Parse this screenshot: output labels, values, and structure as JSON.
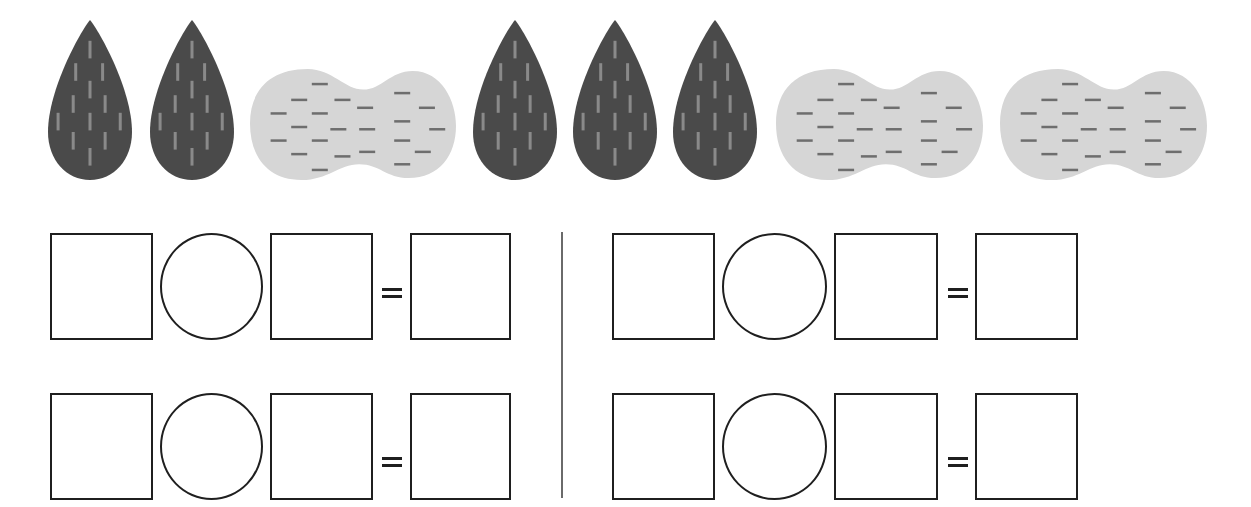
{
  "worksheet": {
    "title": "Count and write number sentences",
    "colors": {
      "almond_fill": "#4a4a4a",
      "almond_stripe": "#8a8a8a",
      "peanut_fill": "#d6d6d6",
      "peanut_dash": "#6e6e6e",
      "outline": "#1f1f1f",
      "divider": "#6a6a6a"
    },
    "picture_row": {
      "items": [
        {
          "icon": "almond-icon",
          "x": 48,
          "y": 20,
          "w": 84,
          "h": 160
        },
        {
          "icon": "almond-icon",
          "x": 150,
          "y": 20,
          "w": 84,
          "h": 160
        },
        {
          "icon": "peanut-icon",
          "x": 250,
          "y": 67,
          "w": 206,
          "h": 113
        },
        {
          "icon": "almond-icon",
          "x": 473,
          "y": 20,
          "w": 84,
          "h": 160
        },
        {
          "icon": "almond-icon",
          "x": 573,
          "y": 20,
          "w": 84,
          "h": 160
        },
        {
          "icon": "almond-icon",
          "x": 673,
          "y": 20,
          "w": 84,
          "h": 160
        },
        {
          "icon": "peanut-icon",
          "x": 776,
          "y": 67,
          "w": 207,
          "h": 113
        },
        {
          "icon": "peanut-icon",
          "x": 1000,
          "y": 67,
          "w": 207,
          "h": 113
        }
      ],
      "counts": {
        "almonds": 5,
        "peanuts": 3
      }
    },
    "equations": [
      {
        "id": "left-top",
        "operand1": "",
        "operator": "",
        "operand2": "",
        "equals": "=",
        "result": ""
      },
      {
        "id": "left-bottom",
        "operand1": "",
        "operator": "",
        "operand2": "",
        "equals": "=",
        "result": ""
      },
      {
        "id": "right-top",
        "operand1": "",
        "operator": "",
        "operand2": "",
        "equals": "=",
        "result": ""
      },
      {
        "id": "right-bottom",
        "operand1": "",
        "operator": "",
        "operand2": "",
        "equals": "=",
        "result": ""
      }
    ]
  }
}
